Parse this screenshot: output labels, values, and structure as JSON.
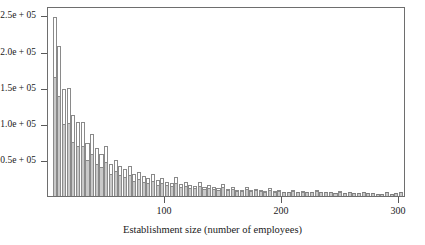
{
  "chart_data": {
    "type": "bar",
    "title": "",
    "subtitle": "",
    "xlabel": "Establishment size (number of employees)",
    "ylabel": "",
    "xlim": [
      0,
      306
    ],
    "ylim": [
      0,
      263000
    ],
    "grid": false,
    "legend": null,
    "annotations": [],
    "yticks": [
      50000,
      100000,
      150000,
      200000,
      250000
    ],
    "ytick_labels": [
      "0.5e + 05",
      "1.0e + 05",
      "1.5e + 05",
      "2.0e + 05",
      "2.5e + 05"
    ],
    "xticks": [
      100,
      200,
      300
    ],
    "xtick_labels": [
      "100",
      "200",
      "300"
    ],
    "bar_fill": "#c9c9c9",
    "bar_edge": "#8a8a8a",
    "axis_color": "#6e6e6e",
    "bin_width": 4,
    "x": [
      6,
      10,
      14,
      18,
      22,
      26,
      30,
      34,
      38,
      42,
      46,
      50,
      54,
      58,
      62,
      66,
      70,
      74,
      78,
      82,
      86,
      90,
      94,
      98,
      102,
      106,
      110,
      114,
      118,
      122,
      126,
      130,
      134,
      138,
      142,
      146,
      150,
      154,
      158,
      162,
      166,
      170,
      174,
      178,
      182,
      186,
      190,
      194,
      198,
      202,
      206,
      210,
      214,
      218,
      222,
      226,
      230,
      234,
      238,
      242,
      246,
      250,
      254,
      258,
      262,
      266,
      270,
      274,
      278,
      282,
      286,
      290,
      294,
      298,
      302
    ],
    "values": [
      248000,
      207000,
      148000,
      150000,
      112000,
      103000,
      103000,
      73000,
      86000,
      66000,
      58000,
      69000,
      45000,
      50000,
      41000,
      37000,
      41000,
      30000,
      33000,
      28000,
      25000,
      30000,
      22000,
      25000,
      20000,
      18000,
      26000,
      17000,
      19000,
      15000,
      14000,
      19000,
      13000,
      15000,
      12000,
      11000,
      16000,
      10000,
      12000,
      9000,
      9000,
      13000,
      8000,
      10000,
      8000,
      7000,
      11000,
      7000,
      8000,
      6000,
      6000,
      9000,
      6000,
      7000,
      5000,
      5000,
      8000,
      5000,
      6000,
      5000,
      4000,
      7000,
      4000,
      5000,
      4000,
      4000,
      6000,
      4000,
      4000,
      3000,
      3000,
      5000,
      3000,
      4000,
      5000
    ]
  }
}
